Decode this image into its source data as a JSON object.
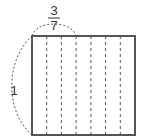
{
  "diagram": {
    "square": {
      "side_label": "1",
      "strips": 7
    },
    "top_brace": {
      "numerator": "3",
      "denominator": "7",
      "spans_strips": 3
    },
    "left_brace": {
      "label": "1"
    },
    "colors": {
      "stroke": "#555555",
      "dash": "#555555",
      "text": "#333333"
    }
  }
}
